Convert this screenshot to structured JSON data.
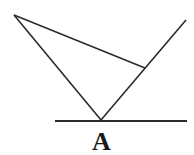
{
  "diagram": {
    "type": "geometry",
    "stroke_color": "#2b2b2b",
    "points": {
      "A": {
        "x": 101,
        "y": 120
      },
      "P": {
        "x": 14,
        "y": 15
      },
      "Q": {
        "x": 145,
        "y": 68
      },
      "R": {
        "x": 186,
        "y": 20
      }
    },
    "baseline": {
      "x1": 55,
      "y1": 121,
      "x2": 187,
      "y2": 121
    },
    "labels": [
      {
        "text": "A",
        "x": 92,
        "y": 129
      }
    ]
  }
}
